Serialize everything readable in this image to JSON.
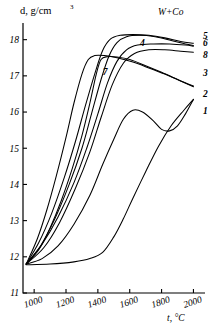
{
  "chart_data": {
    "type": "line",
    "title": "W+Co",
    "xlabel": "t, °C",
    "ylabel": "d, g/cm3",
    "ylabel_display": "d, g/cm",
    "ylabel_exponent": "3",
    "xlim": [
      930,
      2060
    ],
    "ylim": [
      11,
      18.35
    ],
    "xticks": [
      1000,
      1200,
      1400,
      1600,
      1800,
      2000
    ],
    "yticks": [
      11,
      12,
      13,
      14,
      15,
      16,
      17,
      18
    ],
    "grid": false,
    "legend_position": "right-edge-labels",
    "series": [
      {
        "name": "1",
        "label": "1",
        "label_x": 2060,
        "label_y": 16.05,
        "points": [
          [
            950,
            11.78
          ],
          [
            1100,
            11.8
          ],
          [
            1250,
            11.86
          ],
          [
            1350,
            11.95
          ],
          [
            1430,
            12.12
          ],
          [
            1500,
            12.55
          ],
          [
            1560,
            13.05
          ],
          [
            1620,
            13.62
          ],
          [
            1700,
            14.35
          ],
          [
            1780,
            15.05
          ],
          [
            1860,
            15.62
          ],
          [
            1940,
            16.05
          ],
          [
            2000,
            16.35
          ]
        ]
      },
      {
        "name": "2",
        "label": "2",
        "label_x": 2060,
        "label_y": 16.5,
        "points": [
          [
            950,
            11.8
          ],
          [
            1050,
            11.95
          ],
          [
            1150,
            12.3
          ],
          [
            1250,
            12.9
          ],
          [
            1350,
            13.7
          ],
          [
            1430,
            14.55
          ],
          [
            1500,
            15.25
          ],
          [
            1560,
            15.8
          ],
          [
            1620,
            16.05
          ],
          [
            1680,
            16.0
          ],
          [
            1750,
            15.75
          ],
          [
            1800,
            15.52
          ],
          [
            1850,
            15.48
          ],
          [
            1900,
            15.62
          ],
          [
            1950,
            15.95
          ],
          [
            2000,
            16.35
          ]
        ]
      },
      {
        "name": "3",
        "label": "3",
        "label_x": 2060,
        "label_y": 17.1,
        "points": [
          [
            950,
            11.8
          ],
          [
            1030,
            12.2
          ],
          [
            1100,
            12.8
          ],
          [
            1170,
            13.55
          ],
          [
            1240,
            14.45
          ],
          [
            1300,
            15.35
          ],
          [
            1350,
            16.25
          ],
          [
            1390,
            17.05
          ],
          [
            1420,
            17.45
          ],
          [
            1460,
            17.53
          ],
          [
            1520,
            17.52
          ],
          [
            1600,
            17.45
          ],
          [
            1700,
            17.28
          ],
          [
            1800,
            17.1
          ],
          [
            1900,
            16.9
          ],
          [
            2000,
            16.7
          ]
        ]
      },
      {
        "name": "4",
        "label": "4",
        "label_x": 1665,
        "label_y": 17.92,
        "points": [
          [
            950,
            11.8
          ],
          [
            1050,
            12.35
          ],
          [
            1150,
            13.1
          ],
          [
            1250,
            14.05
          ],
          [
            1330,
            15.0
          ],
          [
            1400,
            15.95
          ],
          [
            1460,
            16.8
          ],
          [
            1520,
            17.4
          ],
          [
            1580,
            17.72
          ],
          [
            1650,
            17.85
          ],
          [
            1750,
            17.88
          ],
          [
            1850,
            17.88
          ],
          [
            1950,
            17.85
          ],
          [
            2000,
            17.82
          ]
        ]
      },
      {
        "name": "5",
        "label": "5",
        "label_x": 2060,
        "label_y": 18.12,
        "points": [
          [
            950,
            11.8
          ],
          [
            1030,
            12.4
          ],
          [
            1110,
            13.2
          ],
          [
            1190,
            14.2
          ],
          [
            1260,
            15.2
          ],
          [
            1320,
            16.15
          ],
          [
            1380,
            17.05
          ],
          [
            1430,
            17.7
          ],
          [
            1480,
            18.02
          ],
          [
            1540,
            18.12
          ],
          [
            1620,
            18.14
          ],
          [
            1720,
            18.12
          ],
          [
            1820,
            18.05
          ],
          [
            1920,
            17.95
          ],
          [
            2000,
            17.9
          ]
        ]
      },
      {
        "name": "6",
        "label": "6",
        "label_x": 2060,
        "label_y": 17.92,
        "points": [
          [
            950,
            11.8
          ],
          [
            1040,
            12.3
          ],
          [
            1130,
            13.05
          ],
          [
            1220,
            14.0
          ],
          [
            1300,
            15.0
          ],
          [
            1360,
            15.95
          ],
          [
            1420,
            16.9
          ],
          [
            1470,
            17.55
          ],
          [
            1520,
            17.92
          ],
          [
            1580,
            18.08
          ],
          [
            1660,
            18.12
          ],
          [
            1760,
            18.08
          ],
          [
            1860,
            17.98
          ],
          [
            1950,
            17.88
          ],
          [
            2000,
            17.84
          ]
        ]
      },
      {
        "name": "7",
        "label": "7",
        "label_x": 1430,
        "label_y": 17.12,
        "points": [
          [
            950,
            11.8
          ],
          [
            1020,
            12.5
          ],
          [
            1080,
            13.3
          ],
          [
            1140,
            14.25
          ],
          [
            1200,
            15.3
          ],
          [
            1250,
            16.25
          ],
          [
            1300,
            17.05
          ],
          [
            1340,
            17.45
          ],
          [
            1380,
            17.56
          ],
          [
            1440,
            17.56
          ],
          [
            1520,
            17.5
          ],
          [
            1620,
            17.38
          ],
          [
            1720,
            17.22
          ],
          [
            1820,
            17.05
          ],
          [
            1910,
            16.88
          ],
          [
            2000,
            16.72
          ]
        ]
      },
      {
        "name": "8",
        "label": "8",
        "label_x": 2060,
        "label_y": 17.6,
        "points": [
          [
            950,
            11.8
          ],
          [
            1060,
            12.25
          ],
          [
            1160,
            12.95
          ],
          [
            1260,
            13.9
          ],
          [
            1350,
            14.9
          ],
          [
            1420,
            15.85
          ],
          [
            1490,
            16.75
          ],
          [
            1560,
            17.35
          ],
          [
            1630,
            17.62
          ],
          [
            1720,
            17.72
          ],
          [
            1820,
            17.72
          ],
          [
            1920,
            17.68
          ],
          [
            2000,
            17.65
          ]
        ]
      }
    ]
  },
  "axes": {
    "y_tick_labels": [
      "18",
      "17",
      "16",
      "15",
      "14",
      "13",
      "12",
      "11"
    ],
    "x_tick_labels": [
      "1000",
      "1200",
      "1400",
      "1600",
      "1800",
      "2000"
    ]
  }
}
